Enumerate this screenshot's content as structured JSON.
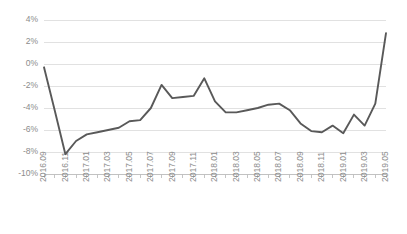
{
  "chart_data": {
    "type": "line",
    "title": "",
    "subtitle": "",
    "xlabel": "",
    "ylabel": "",
    "grid": true,
    "legend_position": "none",
    "ylim": [
      -10,
      4
    ],
    "y_ticks": [
      4,
      2,
      0,
      -2,
      -4,
      -6,
      -8,
      -10
    ],
    "y_tick_labels": [
      "4%",
      "2%",
      "0%",
      "-2%",
      "-4%",
      "-6%",
      "-8%",
      "-10%"
    ],
    "x_tick_labels": [
      "2016.09",
      "2016.11",
      "2017.01",
      "2017.03",
      "2017.05",
      "2017.07",
      "2017.09",
      "2017.11",
      "2018.01",
      "2018.03",
      "2018.05",
      "2018.07",
      "2018.09",
      "2018.11",
      "2019.01",
      "2019.03",
      "2019.05"
    ],
    "x": [
      "2016.09",
      "2016.10",
      "2016.11",
      "2016.12",
      "2017.01",
      "2017.02",
      "2017.03",
      "2017.04",
      "2017.05",
      "2017.06",
      "2017.07",
      "2017.08",
      "2017.09",
      "2017.10",
      "2017.11",
      "2017.12",
      "2018.01",
      "2018.02",
      "2018.03",
      "2018.04",
      "2018.05",
      "2018.06",
      "2018.07",
      "2018.08",
      "2018.09",
      "2018.10",
      "2018.11",
      "2018.12",
      "2019.01",
      "2019.02",
      "2019.03",
      "2019.04",
      "2019.05"
    ],
    "series": [
      {
        "name": "Growth rate",
        "color": "#595959",
        "values": [
          -0.3,
          -4.2,
          -8.2,
          -7.0,
          -6.4,
          -6.2,
          -6.0,
          -5.8,
          -5.2,
          -5.1,
          -4.0,
          -1.9,
          -3.1,
          -3.0,
          -2.9,
          -1.3,
          -3.4,
          -4.4,
          -4.4,
          -4.2,
          -4.0,
          -3.7,
          -3.6,
          -4.2,
          -5.4,
          -6.1,
          -6.2,
          -5.6,
          -6.3,
          -4.6,
          -5.6,
          -3.6,
          2.8
        ]
      }
    ]
  },
  "plot": {
    "left": 44,
    "right": 386,
    "top": 20,
    "bottom": 174,
    "axis_color": "#bfbfbf",
    "grid_color": "#d9d9d9",
    "tick_label_color": "#8c8c8c",
    "background": "#ffffff"
  }
}
